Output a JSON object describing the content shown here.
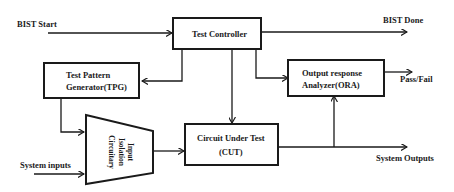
{
  "diagram": {
    "signals": {
      "bist_start": "BIST Start",
      "bist_done": "BIST Done",
      "pass_fail": "Pass/Fail",
      "system_inputs": "System inputs",
      "system_outputs": "System Outputs"
    },
    "blocks": {
      "test_controller": "Test Controller",
      "tpg_line1": "Test Pattern",
      "tpg_line2": "Generator(TPG)",
      "ora_line1": "Output response",
      "ora_line2": "Analyzer(ORA)",
      "cut_line1": "Circuit Under Test",
      "cut_line2": "(CUT)",
      "isolation_line1": "Input",
      "isolation_line2": "Isolation",
      "isolation_line3": "Circuitary"
    },
    "colors": {
      "line": "#1a1a1a",
      "background": "#ffffff"
    }
  }
}
